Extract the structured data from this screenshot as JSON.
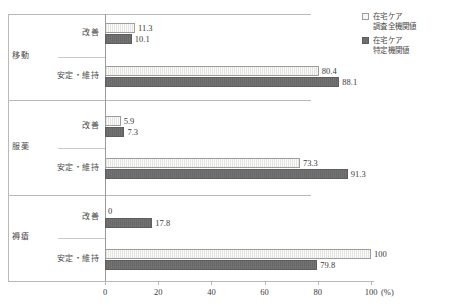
{
  "chart_data": {
    "type": "bar",
    "orientation": "horizontal",
    "title": "",
    "xlabel": "(%)",
    "ylabel": "",
    "xlim": [
      0,
      100
    ],
    "xticks": [
      "0",
      "20",
      "40",
      "60",
      "80",
      "100"
    ],
    "grid": false,
    "legend_position": "top-right",
    "axis_unit": "(%)",
    "series": [
      {
        "name": "在宅ケア調査全機関値",
        "key": "all",
        "color": "#f2f2f0"
      },
      {
        "name": "在宅ケア特定機関値",
        "key": "specific",
        "color": "#6e6e6e"
      }
    ],
    "groups": [
      {
        "category": "移動",
        "rows": [
          {
            "label": "改善",
            "values": [
              11.3,
              10.1
            ],
            "value_labels": [
              "11.3",
              "10.1"
            ]
          },
          {
            "label": "安定・維持",
            "values": [
              80.4,
              88.1
            ],
            "value_labels": [
              "80.4",
              "88.1"
            ]
          }
        ]
      },
      {
        "category": "服薬",
        "rows": [
          {
            "label": "改善",
            "values": [
              5.9,
              7.3
            ],
            "value_labels": [
              "5.9",
              "7.3"
            ]
          },
          {
            "label": "安定・維持",
            "values": [
              73.3,
              91.3
            ],
            "value_labels": [
              "73.3",
              "91.3"
            ]
          }
        ]
      },
      {
        "category": "褥瘡",
        "rows": [
          {
            "label": "改善",
            "values": [
              0,
              17.8
            ],
            "value_labels": [
              "0",
              "17.8"
            ]
          },
          {
            "label": "安定・維持",
            "values": [
              100,
              79.8
            ],
            "value_labels": [
              "100",
              "79.8"
            ]
          }
        ]
      }
    ]
  },
  "legend": {
    "items": [
      {
        "line1": "在宅ケア",
        "line2": "調査全機関値",
        "swatch": "light"
      },
      {
        "line1": "在宅ケア",
        "line2": "特定機関値",
        "swatch": "dark"
      }
    ]
  },
  "axis": {
    "unit": "(%)",
    "ticks": [
      "0",
      "20",
      "40",
      "60",
      "80",
      "100"
    ]
  }
}
